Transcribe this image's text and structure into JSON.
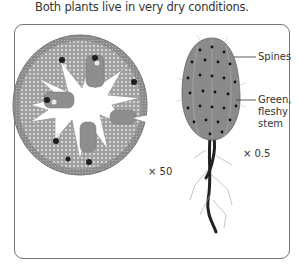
{
  "caption": "Both plants live in very dry conditions.",
  "figure": {
    "left_plant": {
      "description": "cross-section of plant stem/leaf",
      "magnification": "× 50"
    },
    "right_plant": {
      "description": "cactus-like plant with roots",
      "labels": {
        "spines": "Spines",
        "stem_line1": "Green,",
        "stem_line2": "fleshy",
        "stem_line3": "stem"
      },
      "magnification": "× 0.5"
    }
  },
  "colors": {
    "frame": "#777777",
    "tissue": "#9a9a9a",
    "dark": "#222222",
    "text": "#333333"
  }
}
